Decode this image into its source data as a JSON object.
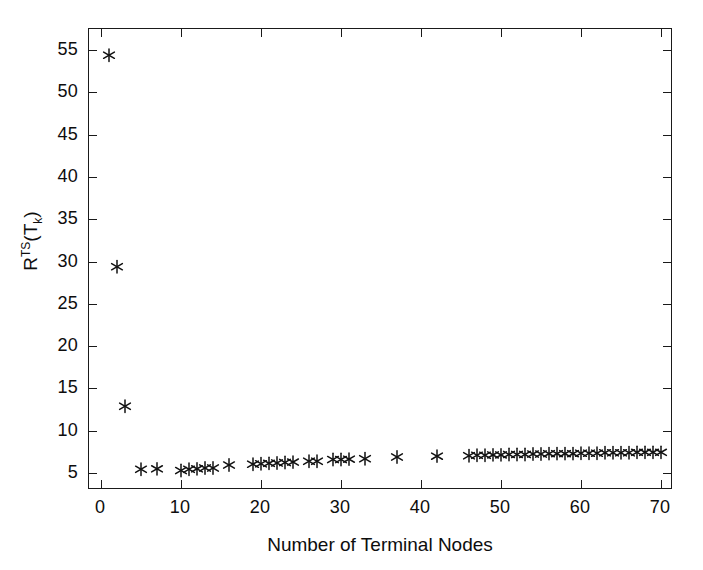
{
  "chart_data": {
    "type": "scatter",
    "title": "",
    "xlabel": "Number of Terminal Nodes",
    "ylabel": "R^TS(T_k)",
    "ylabel_parts": {
      "base": "R",
      "superscript": "TS",
      "open": "(T",
      "subscript": "k",
      "close": ")"
    },
    "xlim": [
      -1.5,
      71.5
    ],
    "ylim": [
      3.0,
      57.5
    ],
    "xticks": [
      0,
      10,
      20,
      30,
      40,
      50,
      60,
      70
    ],
    "yticks": [
      5,
      10,
      15,
      20,
      25,
      30,
      35,
      40,
      45,
      50,
      55
    ],
    "xticklabels": [
      "0",
      "10",
      "20",
      "30",
      "40",
      "50",
      "60",
      "70"
    ],
    "yticklabels": [
      "5",
      "10",
      "15",
      "20",
      "25",
      "30",
      "35",
      "40",
      "45",
      "50",
      "55"
    ],
    "grid": false,
    "legend": false,
    "marker": "asterisk",
    "marker_color": "#111111",
    "series": [
      {
        "name": "R^TS(T_k)",
        "points": [
          [
            1,
            54.4
          ],
          [
            2,
            29.4
          ],
          [
            3,
            12.9
          ],
          [
            5,
            5.45
          ],
          [
            7,
            5.5
          ],
          [
            10,
            5.3
          ],
          [
            11,
            5.45
          ],
          [
            12,
            5.5
          ],
          [
            13,
            5.6
          ],
          [
            14,
            5.6
          ],
          [
            16,
            5.95
          ],
          [
            19,
            6.05
          ],
          [
            20,
            6.1
          ],
          [
            21,
            6.15
          ],
          [
            22,
            6.2
          ],
          [
            23,
            6.25
          ],
          [
            24,
            6.3
          ],
          [
            26,
            6.4
          ],
          [
            27,
            6.4
          ],
          [
            29,
            6.6
          ],
          [
            30,
            6.6
          ],
          [
            31,
            6.65
          ],
          [
            33,
            6.7
          ],
          [
            37,
            6.9
          ],
          [
            42,
            7.0
          ],
          [
            46,
            7.05
          ],
          [
            47,
            7.1
          ],
          [
            48,
            7.1
          ],
          [
            49,
            7.15
          ],
          [
            50,
            7.15
          ],
          [
            51,
            7.2
          ],
          [
            52,
            7.2
          ],
          [
            53,
            7.2
          ],
          [
            54,
            7.25
          ],
          [
            55,
            7.25
          ],
          [
            56,
            7.3
          ],
          [
            57,
            7.3
          ],
          [
            58,
            7.3
          ],
          [
            59,
            7.3
          ],
          [
            60,
            7.35
          ],
          [
            61,
            7.35
          ],
          [
            62,
            7.35
          ],
          [
            63,
            7.4
          ],
          [
            64,
            7.4
          ],
          [
            65,
            7.4
          ],
          [
            66,
            7.4
          ],
          [
            67,
            7.45
          ],
          [
            68,
            7.45
          ],
          [
            69,
            7.45
          ],
          [
            70,
            7.45
          ]
        ]
      }
    ]
  }
}
